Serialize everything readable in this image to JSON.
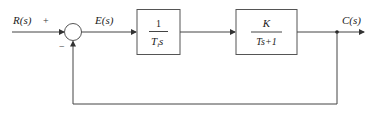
{
  "diagram": {
    "type": "block-diagram",
    "signals": {
      "input": "R(s)",
      "error": "E(s)",
      "output": "C(s)"
    },
    "summing_junction": {
      "plus_sign": "+",
      "minus_sign": "−"
    },
    "blocks": [
      {
        "numerator": "1",
        "denominator_main": "T",
        "denominator_sub": "i",
        "denominator_tail": "s"
      },
      {
        "numerator": "K",
        "denominator_main": "Ts+1",
        "denominator_sub": "",
        "denominator_tail": ""
      }
    ],
    "feedback": "unity negative feedback"
  }
}
